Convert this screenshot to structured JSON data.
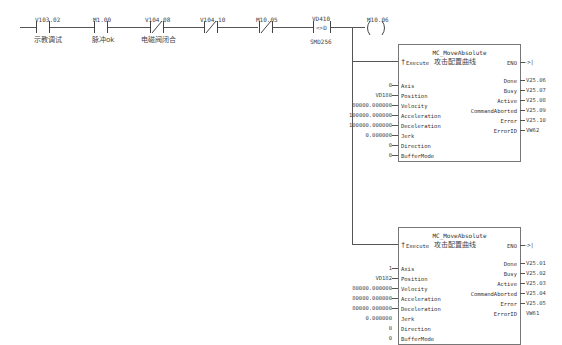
{
  "rung": {
    "contacts": [
      {
        "address": "V103.02",
        "comment": "示教调试",
        "type": "NO"
      },
      {
        "address": "M1.00",
        "comment": "脉冲ok",
        "type": "NO"
      },
      {
        "address": "V104.08",
        "comment": "电磁阀闭合",
        "type": "NC"
      },
      {
        "address": "V104.10",
        "comment": "",
        "type": "NC"
      },
      {
        "address": "M10.05",
        "comment": "",
        "type": "NC"
      }
    ],
    "compare": {
      "top": "VD410",
      "op": "<>D",
      "bottom": "SMD256"
    },
    "coil": {
      "address": "M10.06"
    }
  },
  "blocks": [
    {
      "title": "MC_MoveAbsolute",
      "execute_label": "Execute",
      "execute_comment": "攻击配置曲线",
      "eno_label": "ENO",
      "eno_out": "->|",
      "inputs": [
        {
          "pin": "Axis",
          "value": "0"
        },
        {
          "pin": "Position",
          "value": "VD180"
        },
        {
          "pin": "Velocity",
          "value": "80000.000000"
        },
        {
          "pin": "Acceleration",
          "value": "100000.000000"
        },
        {
          "pin": "Deceleration",
          "value": "100000.000000"
        },
        {
          "pin": "Jerk",
          "value": "0.000000"
        },
        {
          "pin": "Direction",
          "value": "0"
        },
        {
          "pin": "BufferMode",
          "value": "0"
        }
      ],
      "outputs": [
        {
          "pin": "Done",
          "value": "V25.06"
        },
        {
          "pin": "Busy",
          "value": "V25.07"
        },
        {
          "pin": "Active",
          "value": "V25.08"
        },
        {
          "pin": "CommandAborted",
          "value": "V25.09"
        },
        {
          "pin": "Error",
          "value": "V25.10"
        },
        {
          "pin": "ErrorID",
          "value": "VW62"
        }
      ]
    },
    {
      "title": "MC_MoveAbsolute",
      "execute_label": "Execute",
      "execute_comment": "攻击配置曲线",
      "eno_label": "ENO",
      "eno_out": "->|",
      "inputs": [
        {
          "pin": "Axis",
          "value": "1"
        },
        {
          "pin": "Position",
          "value": "VD182"
        },
        {
          "pin": "Velocity",
          "value": "80000.000000"
        },
        {
          "pin": "Acceleration",
          "value": "80000.000000"
        },
        {
          "pin": "Deceleration",
          "value": "80000.000000"
        },
        {
          "pin": "Jerk",
          "value": "0.000000"
        },
        {
          "pin": "Direction",
          "value": "0"
        },
        {
          "pin": "BufferMode",
          "value": "0"
        }
      ],
      "outputs": [
        {
          "pin": "Done",
          "value": "V25.01"
        },
        {
          "pin": "Busy",
          "value": "V25.02"
        },
        {
          "pin": "Active",
          "value": "V25.03"
        },
        {
          "pin": "CommandAborted",
          "value": "V25.04"
        },
        {
          "pin": "Error",
          "value": "V25.05"
        },
        {
          "pin": "ErrorID",
          "value": "VW61"
        }
      ]
    }
  ]
}
